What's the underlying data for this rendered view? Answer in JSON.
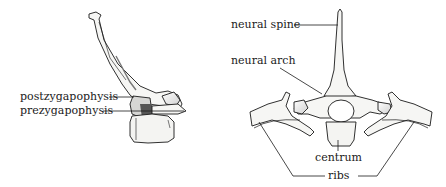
{
  "figure": {
    "left_view": {
      "title": "lateral view of vertebra",
      "labels": [
        {
          "id": "postzygapophysis",
          "text": "postzygapophysis"
        },
        {
          "id": "prezygapophysis",
          "text": "prezygapophysis"
        }
      ]
    },
    "right_view": {
      "title": "anterior view of vertebra with ribs",
      "labels": [
        {
          "id": "neural_spine",
          "text": "neural spine"
        },
        {
          "id": "neural_arch",
          "text": "neural arch"
        },
        {
          "id": "centrum",
          "text": "centrum"
        },
        {
          "id": "ribs",
          "text": "ribs"
        }
      ]
    },
    "colors": {
      "ink": "#1a1a1a",
      "bone_fill": "#f4f4f2",
      "shade": "#8a8a8a",
      "background": "#ffffff"
    }
  }
}
